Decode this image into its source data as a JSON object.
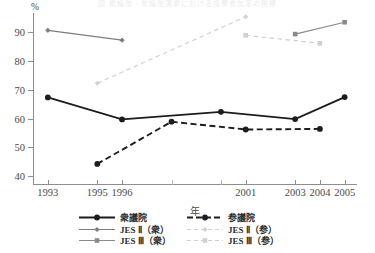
{
  "clipped_caption": {
    "text": "図 衆議院・参議院選挙における投票参加率の推移"
  },
  "axes": {
    "y_unit_label": "%",
    "y_ticks": [
      40,
      50,
      60,
      70,
      80,
      90
    ],
    "y_min": 37,
    "y_max": 96.5,
    "x_axis_title": "年",
    "x_ticks": [
      {
        "year": 1993,
        "label": "1993",
        "major": true
      },
      {
        "year": 1995,
        "label": "1995",
        "major": true
      },
      {
        "year": 1996,
        "label": "1996",
        "major": true
      },
      {
        "year": 1998,
        "label": "",
        "major": false
      },
      {
        "year": 2000,
        "label": "",
        "major": false
      },
      {
        "year": 2001,
        "label": "2001",
        "major": true
      },
      {
        "year": 2003,
        "label": "2003",
        "major": true
      },
      {
        "year": 2004,
        "label": "2004",
        "major": true
      },
      {
        "year": 2005,
        "label": "2005",
        "major": true
      }
    ],
    "x_min": 1992.4,
    "x_max": 2005.5
  },
  "legend": {
    "position": "bottom",
    "entries": [
      {
        "label": "衆議院",
        "color": "#1c1c1c",
        "dash": "solid",
        "marker": "circle",
        "marker_size": 5.0
      },
      {
        "label": "参議院",
        "color": "#1c1c1c",
        "dash": "dashed",
        "marker": "circle",
        "marker_size": 5.0
      },
      {
        "label": "JES Ⅱ（衆）",
        "color": "#7d7d7d",
        "dash": "solid",
        "marker": "diamond",
        "marker_size": 4.2
      },
      {
        "label": "JES Ⅱ（参）",
        "color": "#d2d2d2",
        "dash": "dashed",
        "marker": "diamond",
        "marker_size": 4.2
      },
      {
        "label": "JES Ⅲ（衆）",
        "color": "#8a8a8a",
        "dash": "solid",
        "marker": "square",
        "marker_size": 4.6
      },
      {
        "label": "JES Ⅲ（参）",
        "color": "#cfcfcf",
        "dash": "dashed",
        "marker": "square",
        "marker_size": 4.6
      }
    ]
  },
  "chart_data": {
    "type": "line",
    "title": "",
    "xlabel": "年",
    "ylabel": "%",
    "ylim": [
      37,
      96.5
    ],
    "xlim": [
      1992.4,
      2005.5
    ],
    "grid": false,
    "legend_position": "bottom",
    "categories": [
      1993,
      1995,
      1996,
      1998,
      2000,
      2001,
      2003,
      2004,
      2005
    ],
    "series": [
      {
        "name": "衆議院",
        "color": "#1c1c1c",
        "dash": "solid",
        "marker": "circle",
        "points": [
          {
            "x": 1993,
            "y": 67.3
          },
          {
            "x": 1996,
            "y": 59.7
          },
          {
            "x": 2000,
            "y": 62.3
          },
          {
            "x": 2003,
            "y": 59.8
          },
          {
            "x": 2005,
            "y": 67.4
          }
        ]
      },
      {
        "name": "参議院",
        "color": "#1c1c1c",
        "dash": "dashed",
        "marker": "circle",
        "points": [
          {
            "x": 1995,
            "y": 44.3
          },
          {
            "x": 1998,
            "y": 58.9
          },
          {
            "x": 2001,
            "y": 56.2
          },
          {
            "x": 2004,
            "y": 56.4
          }
        ]
      },
      {
        "name": "JES Ⅱ（衆）",
        "color": "#7d7d7d",
        "dash": "solid",
        "marker": "diamond",
        "points": [
          {
            "x": 1993,
            "y": 90.5
          },
          {
            "x": 1996,
            "y": 87.1
          }
        ]
      },
      {
        "name": "JES Ⅱ（参）",
        "color": "#d2d2d2",
        "dash": "dashed",
        "marker": "diamond",
        "points": [
          {
            "x": 1995,
            "y": 72.2
          },
          {
            "x": 2001,
            "y": 95.2
          }
        ]
      },
      {
        "name": "JES Ⅲ（衆）",
        "color": "#8a8a8a",
        "dash": "solid",
        "marker": "square",
        "points": [
          {
            "x": 2003,
            "y": 89.2
          },
          {
            "x": 2005,
            "y": 93.3
          }
        ]
      },
      {
        "name": "JES Ⅲ（参）",
        "color": "#cfcfcf",
        "dash": "dashed",
        "marker": "square",
        "points": [
          {
            "x": 2001,
            "y": 88.8
          },
          {
            "x": 2004,
            "y": 86.0
          }
        ]
      }
    ]
  }
}
